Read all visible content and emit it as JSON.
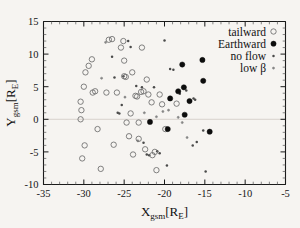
{
  "chart_data": {
    "type": "scatter",
    "title": "",
    "xlabel": "X_gsm[R_E]",
    "xlabel_main": "X",
    "xlabel_sub": "gsm",
    "xlabel_rest": "[R",
    "xlabel_sub2": "E",
    "xlabel_end": "]",
    "ylabel": "Y_gsm[R_E]",
    "ylabel_main": "Y",
    "ylabel_sub": "gsm",
    "ylabel_rest": "[R",
    "ylabel_sub2": "E",
    "ylabel_end": "]",
    "xlim": [
      -35,
      -5
    ],
    "ylim": [
      -10,
      15
    ],
    "xticks": [
      -35,
      -30,
      -25,
      -20,
      -15,
      -10,
      -5
    ],
    "xticklabels": [
      "-35",
      "-30",
      "-25",
      "-20",
      "-15",
      "-10",
      "-5"
    ],
    "yticks": [
      -10,
      -5,
      0,
      5,
      10,
      15
    ],
    "yticklabels": [
      "-10",
      "-5",
      "0",
      "5",
      "10",
      "15"
    ],
    "grid": false,
    "zero_line_y": 0,
    "legend_position": "top-right",
    "series": [
      {
        "name": "tailward",
        "marker": "open-circle",
        "color": "#6b6b6b",
        "points": [
          [
            -30.4,
            0.0
          ],
          [
            -30.3,
            1.4
          ],
          [
            -30.4,
            2.7
          ],
          [
            -30.0,
            5.0
          ],
          [
            -29.8,
            7.2
          ],
          [
            -29.4,
            8.2
          ],
          [
            -29.0,
            9.2
          ],
          [
            -28.9,
            4.1
          ],
          [
            -28.6,
            4.3
          ],
          [
            -30.2,
            -6.0
          ],
          [
            -29.9,
            -4.0
          ],
          [
            -28.3,
            -1.5
          ],
          [
            -27.9,
            -7.6
          ],
          [
            -27.2,
            4.1
          ],
          [
            -26.9,
            12.2
          ],
          [
            -26.5,
            12.3
          ],
          [
            -25.9,
            4.1
          ],
          [
            -25.4,
            11.0
          ],
          [
            -25.1,
            12.0
          ],
          [
            -25.0,
            9.0
          ],
          [
            -25.0,
            6.6
          ],
          [
            -24.8,
            6.5
          ],
          [
            -24.7,
            -0.5
          ],
          [
            -24.4,
            -2.6
          ],
          [
            -24.0,
            7.2
          ],
          [
            -23.6,
            3.6
          ],
          [
            -23.4,
            3.5
          ],
          [
            -23.2,
            -0.5
          ],
          [
            -23.2,
            -3.0
          ],
          [
            -22.9,
            4.2
          ],
          [
            -22.8,
            11.0
          ],
          [
            -22.6,
            4.3
          ],
          [
            -22.4,
            -4.6
          ],
          [
            -22.2,
            6.1
          ],
          [
            -22.0,
            3.8
          ],
          [
            -21.6,
            2.6
          ],
          [
            -21.5,
            -5.5
          ],
          [
            -21.2,
            -5.0
          ],
          [
            -21.0,
            -7.8
          ],
          [
            -20.6,
            3.8
          ],
          [
            -20.3,
            2.3
          ],
          [
            -19.9,
            -1.5
          ],
          [
            -26.3,
            -3.9
          ],
          [
            -23.9,
            -5.4
          ],
          [
            -24.2,
            0.9
          ],
          [
            -18.5,
            2.4
          ]
        ]
      },
      {
        "name": "Earthward",
        "marker": "filled-circle",
        "color": "#0d0d0d",
        "points": [
          [
            -21.8,
            -0.4
          ],
          [
            -19.6,
            -1.5
          ],
          [
            -19.3,
            3.2
          ],
          [
            -18.3,
            4.3
          ],
          [
            -17.8,
            8.4
          ],
          [
            -17.6,
            4.9
          ],
          [
            -17.5,
            0.7
          ],
          [
            -16.9,
            2.8
          ],
          [
            -15.3,
            9.1
          ],
          [
            -15.2,
            5.9
          ],
          [
            -14.4,
            -1.9
          ]
        ]
      },
      {
        "name": "no flow",
        "marker": "small-dot",
        "color": "#4a4a4a",
        "points": [
          [
            -26.5,
            9.6
          ],
          [
            -25.8,
            1.0
          ],
          [
            -25.6,
            0.9
          ],
          [
            -25.3,
            2.2
          ],
          [
            -24.5,
            12.0
          ],
          [
            -24.2,
            11.1
          ],
          [
            -23.5,
            5.1
          ],
          [
            -22.8,
            4.9
          ],
          [
            -22.2,
            -5.4
          ],
          [
            -21.9,
            -5.5
          ],
          [
            -21.3,
            4.9
          ],
          [
            -20.9,
            -4.9
          ],
          [
            -20.6,
            -5.2
          ],
          [
            -20.0,
            12.1
          ],
          [
            -19.7,
            -7.1
          ],
          [
            -19.3,
            7.7
          ],
          [
            -18.9,
            7.6
          ],
          [
            -18.1,
            3.9
          ],
          [
            -17.3,
            4.4
          ],
          [
            -16.4,
            3.2
          ],
          [
            -16.2,
            3.0
          ],
          [
            -16.0,
            -3.5
          ],
          [
            -16.5,
            -4.0
          ],
          [
            -15.2,
            -1.7
          ],
          [
            -14.9,
            -8.0
          ],
          [
            -22.6,
            -3.6
          ],
          [
            -26.2,
            6.4
          ],
          [
            -25.1,
            6.6
          ]
        ]
      },
      {
        "name": "low β",
        "marker": "small-dot-light",
        "color": "#858585",
        "points": [
          [
            -27.3,
            11.8
          ],
          [
            -24.9,
            3.4
          ],
          [
            -23.3,
            -3.3
          ],
          [
            -21.0,
            0.4
          ],
          [
            -19.5,
            1.4
          ],
          [
            -18.3,
            0.3
          ],
          [
            -17.8,
            -0.5
          ],
          [
            -17.2,
            -2.8
          ],
          [
            -20.2,
            1.2
          ],
          [
            -22.5,
            1.0
          ],
          [
            -27.8,
            6.3
          ]
        ]
      }
    ],
    "legend": [
      {
        "label": "tailward",
        "marker": "open-circle"
      },
      {
        "label": "Earthward",
        "marker": "filled-circle"
      },
      {
        "label": "no flow",
        "marker": "small-dot"
      },
      {
        "label": "low β",
        "marker": "small-dot-light"
      }
    ]
  }
}
